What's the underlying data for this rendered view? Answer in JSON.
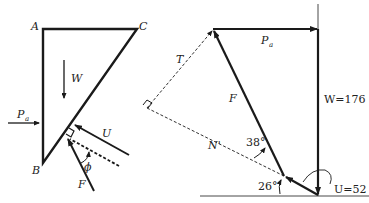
{
  "left_figure": {
    "vertices": {
      "A": "A",
      "B": "B",
      "C": "C"
    },
    "forces": {
      "weight": "W",
      "active_thrust": "P",
      "active_thrust_sub": "a",
      "pore_force": "U",
      "reaction": "F",
      "friction_angle": "ϕ"
    }
  },
  "right_figure": {
    "active_thrust": "P",
    "active_thrust_sub": "a",
    "weight_label": "W=176",
    "pore_label": "U=52",
    "reaction": "F",
    "shear": "T",
    "normal": "N'",
    "angle_1": "38°",
    "angle_2": "26°"
  },
  "colors": {
    "line": "#1a1a1a",
    "text": "#222222",
    "background": "#ffffff"
  }
}
